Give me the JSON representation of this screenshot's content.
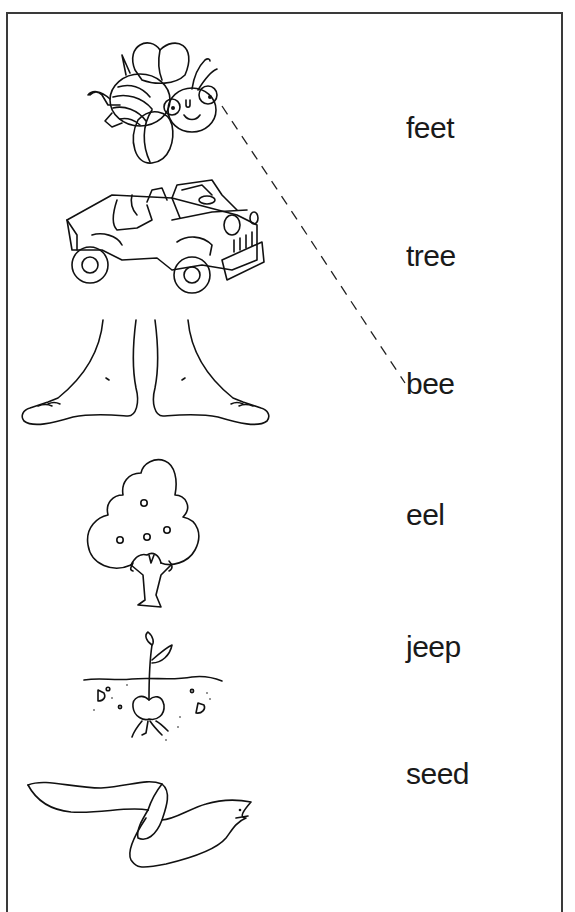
{
  "worksheet": {
    "instructions": "Match each picture to its word",
    "pictures": [
      {
        "id": "bee",
        "label": "bee"
      },
      {
        "id": "jeep",
        "label": "jeep"
      },
      {
        "id": "feet",
        "label": "feet"
      },
      {
        "id": "tree",
        "label": "tree"
      },
      {
        "id": "seed",
        "label": "seed"
      },
      {
        "id": "eel",
        "label": "eel"
      }
    ],
    "words": [
      "feet",
      "tree",
      "bee",
      "eel",
      "jeep",
      "seed"
    ],
    "example_match": {
      "from_picture": "bee",
      "to_word": "bee",
      "style": "dashed"
    }
  },
  "colors": {
    "line": "#111111",
    "text": "#1a1a1a",
    "border": "#3a3a3a",
    "background": "#ffffff"
  }
}
